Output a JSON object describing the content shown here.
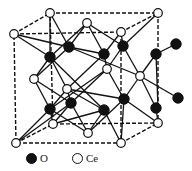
{
  "diagram": {
    "type": "crystal-structure",
    "colors": {
      "oxygen": "#111111",
      "cerium": "#ffffff",
      "lines": "#111111"
    }
  },
  "legend": {
    "items": [
      {
        "symbol": "filled-circle",
        "label": "O"
      },
      {
        "symbol": "open-circle",
        "label": "Ce"
      }
    ]
  }
}
